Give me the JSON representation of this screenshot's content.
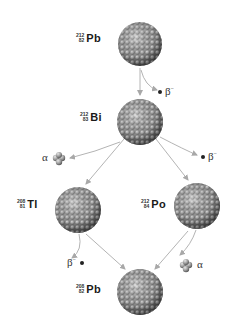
{
  "diagram": {
    "nuclides": [
      {
        "id": "pb212",
        "symbol": "Pb",
        "mass": "212",
        "atomic": "82",
        "cx": 140,
        "cy": 44,
        "r": 22
      },
      {
        "id": "bi212",
        "symbol": "Bi",
        "mass": "212",
        "atomic": "83",
        "cx": 140,
        "cy": 122,
        "r": 23
      },
      {
        "id": "tl208",
        "symbol": "Tl",
        "mass": "208",
        "atomic": "81",
        "cx": 78,
        "cy": 210,
        "r": 23
      },
      {
        "id": "po212",
        "symbol": "Po",
        "mass": "212",
        "atomic": "84",
        "cx": 197,
        "cy": 206,
        "r": 23
      },
      {
        "id": "pb208",
        "symbol": "Pb",
        "mass": "208",
        "atomic": "82",
        "cx": 140,
        "cy": 292,
        "r": 23
      }
    ],
    "decays": [
      {
        "from": "pb212",
        "to": "bi212",
        "type": "beta",
        "label": "β",
        "charge": "−"
      },
      {
        "from": "bi212",
        "to": "tl208",
        "type": "alpha",
        "label": "α"
      },
      {
        "from": "bi212",
        "to": "po212",
        "type": "beta",
        "label": "β",
        "charge": "−"
      },
      {
        "from": "tl208",
        "to": "pb208",
        "type": "beta",
        "label": "β",
        "charge": "−"
      },
      {
        "from": "po212",
        "to": "pb208",
        "type": "alpha",
        "label": "α"
      }
    ],
    "colors": {
      "nucleus_light": "#c8c8c8",
      "nucleus_mid": "#8a8a8a",
      "nucleus_dark": "#4a4a4a",
      "arrow": "#b0b0b0",
      "electron": "#222222",
      "text": "#1a1a1a"
    }
  },
  "labels": {
    "pb212": {
      "mass": "212",
      "atomic": "82",
      "symbol": "Pb"
    },
    "bi212": {
      "mass": "212",
      "atomic": "83",
      "symbol": "Bi"
    },
    "tl208": {
      "mass": "208",
      "atomic": "81",
      "symbol": "Tl"
    },
    "po212": {
      "mass": "212",
      "atomic": "84",
      "symbol": "Po"
    },
    "pb208": {
      "mass": "208",
      "atomic": "82",
      "symbol": "Pb"
    }
  },
  "particles": {
    "beta1": {
      "symbol": "β",
      "charge": "−"
    },
    "alpha1": {
      "symbol": "α"
    },
    "beta2": {
      "symbol": "β",
      "charge": "−"
    },
    "beta3": {
      "symbol": "β",
      "charge": "−"
    },
    "alpha2": {
      "symbol": "α"
    }
  }
}
